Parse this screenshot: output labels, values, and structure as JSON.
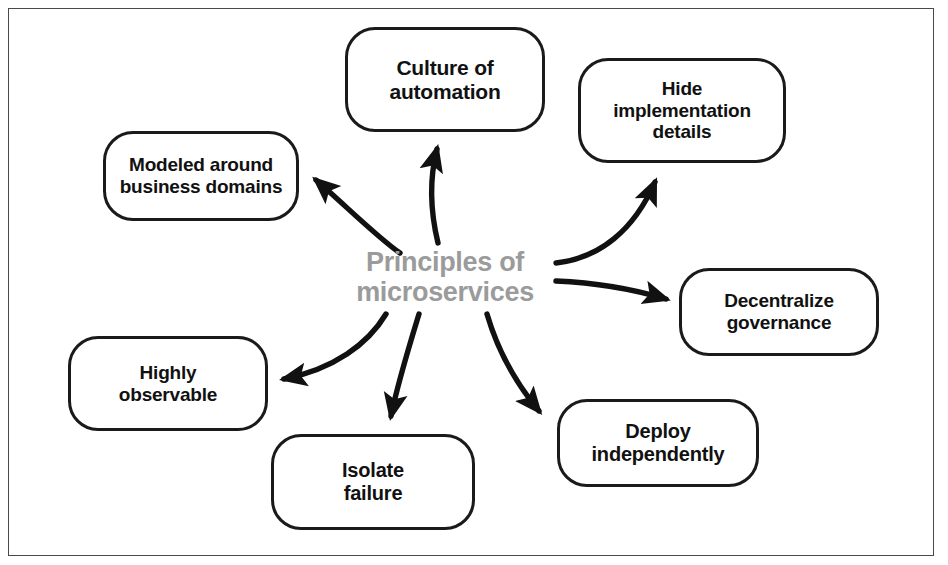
{
  "diagram": {
    "type": "mind-map",
    "frame_color": "#4a4a4a",
    "node_border_color": "#1a1a1a",
    "center_text_color": "#9b9b9b",
    "arrow_color": "#111111",
    "center": {
      "line1": "Principles of",
      "line2": "microservices",
      "text": "Principles of\nmicroservices"
    },
    "nodes": [
      {
        "id": "culture-of-automation",
        "text": "Culture of\nautomation",
        "line1": "Culture of",
        "line2": "automation",
        "x": 345,
        "y": 27,
        "w": 200,
        "h": 105,
        "font_size": 21
      },
      {
        "id": "hide-implementation-details",
        "text": "Hide\nimplementation\ndetails",
        "line1": "Hide",
        "line2": "implementation",
        "line3": "details",
        "x": 578,
        "y": 58,
        "w": 208,
        "h": 105,
        "font_size": 19
      },
      {
        "id": "modeled-around-business-domains",
        "text": "Modeled around\nbusiness domains",
        "line1": "Modeled around",
        "line2": "business domains",
        "x": 103,
        "y": 131,
        "w": 196,
        "h": 90,
        "font_size": 19
      },
      {
        "id": "decentralize-governance",
        "text": "Decentralize\ngovernance",
        "line1": "Decentralize",
        "line2": "governance",
        "x": 679,
        "y": 268,
        "w": 200,
        "h": 88,
        "font_size": 19
      },
      {
        "id": "highly-observable",
        "text": "Highly\nobservable",
        "line1": "Highly",
        "line2": "observable",
        "x": 68,
        "y": 336,
        "w": 200,
        "h": 95,
        "font_size": 19
      },
      {
        "id": "deploy-independently",
        "text": "Deploy\nindependently",
        "line1": "Deploy",
        "line2": "independently",
        "x": 557,
        "y": 399,
        "w": 202,
        "h": 88,
        "font_size": 20
      },
      {
        "id": "isolate-failure",
        "text": "Isolate\nfailure",
        "line1": "Isolate",
        "line2": "failure",
        "x": 271,
        "y": 434,
        "w": 204,
        "h": 96,
        "font_size": 20
      }
    ],
    "arrows": [
      {
        "id": "arrow-to-culture-of-automation",
        "from": "center",
        "to": "culture-of-automation"
      },
      {
        "id": "arrow-to-hide-implementation-details",
        "from": "center",
        "to": "hide-implementation-details"
      },
      {
        "id": "arrow-to-modeled-around-business-domains",
        "from": "center",
        "to": "modeled-around-business-domains"
      },
      {
        "id": "arrow-to-decentralize-governance",
        "from": "center",
        "to": "decentralize-governance"
      },
      {
        "id": "arrow-to-highly-observable",
        "from": "center",
        "to": "highly-observable"
      },
      {
        "id": "arrow-to-deploy-independently",
        "from": "center",
        "to": "deploy-independently"
      },
      {
        "id": "arrow-to-isolate-failure",
        "from": "center",
        "to": "isolate-failure"
      }
    ]
  }
}
